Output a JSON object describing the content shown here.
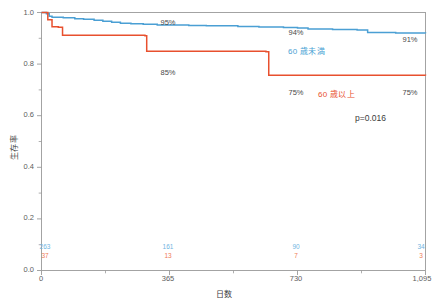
{
  "chart_data": {
    "type": "line",
    "subtype": "kaplan-meier-survival",
    "title": "",
    "xlabel": "日数",
    "ylabel": "生存率",
    "xlim": [
      0,
      1095
    ],
    "ylim": [
      0.0,
      1.0
    ],
    "grid": false,
    "legend_position": "inline-annotation",
    "x_ticks": [
      {
        "value": 0,
        "label": "0"
      },
      {
        "value": 365,
        "label": "365"
      },
      {
        "value": 730,
        "label": "730"
      },
      {
        "value": 1095,
        "label": "1,095"
      }
    ],
    "y_ticks": [
      {
        "value": 0.0,
        "label": "0.0"
      },
      {
        "value": 0.2,
        "label": "0.2"
      },
      {
        "value": 0.4,
        "label": "0.4"
      },
      {
        "value": 0.6,
        "label": "0.6"
      },
      {
        "value": 0.8,
        "label": "0.8"
      },
      {
        "value": 1.0,
        "label": "1.0"
      }
    ],
    "y_minor_ticks": [
      0.1,
      0.3,
      0.5,
      0.7,
      0.9
    ],
    "series": [
      {
        "name": "60 歳未満",
        "color": "#4a9fd4",
        "steps": [
          [
            0,
            1.0
          ],
          [
            14,
            0.995
          ],
          [
            22,
            0.985
          ],
          [
            30,
            0.982
          ],
          [
            62,
            0.98
          ],
          [
            95,
            0.976
          ],
          [
            120,
            0.974
          ],
          [
            150,
            0.97
          ],
          [
            175,
            0.966
          ],
          [
            200,
            0.962
          ],
          [
            225,
            0.958
          ],
          [
            255,
            0.956
          ],
          [
            290,
            0.954
          ],
          [
            330,
            0.952
          ],
          [
            420,
            0.95
          ],
          [
            470,
            0.949
          ],
          [
            560,
            0.946
          ],
          [
            620,
            0.944
          ],
          [
            690,
            0.942
          ],
          [
            730,
            0.94
          ],
          [
            760,
            0.936
          ],
          [
            830,
            0.934
          ],
          [
            900,
            0.932
          ],
          [
            930,
            0.922
          ],
          [
            1010,
            0.921
          ],
          [
            1095,
            0.92
          ]
        ],
        "annotations": [
          {
            "x": 365,
            "y": 0.95,
            "label": "95%"
          },
          {
            "x": 730,
            "y": 0.94,
            "label": "94%"
          },
          {
            "x": 1095,
            "y": 0.91,
            "label": "91%"
          }
        ]
      },
      {
        "name": "60 歳以上",
        "color": "#e8502e",
        "steps": [
          [
            0,
            1.0
          ],
          [
            18,
            0.972
          ],
          [
            30,
            0.945
          ],
          [
            48,
            0.943
          ],
          [
            60,
            0.912
          ],
          [
            295,
            0.91
          ],
          [
            300,
            0.85
          ],
          [
            640,
            0.848
          ],
          [
            648,
            0.757
          ],
          [
            1095,
            0.756
          ]
        ],
        "annotations": [
          {
            "x": 365,
            "y": 0.85,
            "label": "85%"
          },
          {
            "x": 730,
            "y": 0.75,
            "label": "75%"
          },
          {
            "x": 1095,
            "y": 0.75,
            "label": "75%"
          }
        ]
      }
    ],
    "statistic": {
      "label": "p=0.016",
      "p_value": 0.016
    },
    "numbers_at_risk": {
      "times": [
        0,
        365,
        730,
        1095
      ],
      "rows": [
        {
          "series": "60 歳未満",
          "color": "#6fb5df",
          "counts": [
            "263",
            "161",
            "90",
            "34"
          ]
        },
        {
          "series": "60 歳以上",
          "color": "#ef7b57",
          "counts": [
            "37",
            "13",
            "7",
            "3"
          ]
        }
      ]
    }
  },
  "labels": {
    "y_axis_title": "生存率",
    "x_axis_title": "日数",
    "p_value_text": "p=0.016",
    "legend_blue": "60 歳未満",
    "legend_red": "60 歳以上",
    "pct_blue_365": "95%",
    "pct_blue_730": "94%",
    "pct_blue_1095": "91%",
    "pct_red_365": "85%",
    "pct_red_730": "75%",
    "pct_red_1095": "75%",
    "ytick_0": "0.0",
    "ytick_02": "0.2",
    "ytick_04": "0.4",
    "ytick_06": "0.6",
    "ytick_08": "0.8",
    "ytick_10": "1.0",
    "xtick_0": "0",
    "xtick_365": "365",
    "xtick_730": "730",
    "xtick_1095": "1,095",
    "risk_blue_0": "263",
    "risk_blue_365": "161",
    "risk_blue_730": "90",
    "risk_blue_1095": "34",
    "risk_red_0": "37",
    "risk_red_365": "13",
    "risk_red_730": "7",
    "risk_red_1095": "3"
  },
  "colors": {
    "blue": "#4a9fd4",
    "red": "#e8502e",
    "blue_light": "#6fb5df",
    "red_light": "#ef7b57",
    "frame": "#9a9a9a",
    "text": "#3c3c3c"
  }
}
